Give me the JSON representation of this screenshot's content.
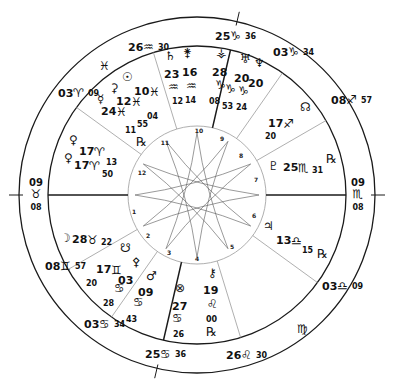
{
  "chart_title": "Natal Chart Wheel",
  "geometry": {
    "cx": 197,
    "cy": 195,
    "r_outer": 178,
    "r_zodiac": 149,
    "r_inner": 69,
    "colors": {
      "line": "#1a1a1a",
      "thin": "#9a9a9a",
      "text": "#111111"
    }
  },
  "house_cusps": [
    {
      "house": 1,
      "angle": 180,
      "heavy": true,
      "ext": true
    },
    {
      "house": 2,
      "angle": 150,
      "heavy": false
    },
    {
      "house": 3,
      "angle": 125,
      "heavy": false
    },
    {
      "house": 4,
      "angle": 103,
      "heavy": true,
      "ext": true
    },
    {
      "house": 5,
      "angle": 73,
      "heavy": false
    },
    {
      "house": 6,
      "angle": 36,
      "heavy": false
    },
    {
      "house": 7,
      "angle": 0,
      "heavy": true,
      "ext": true
    },
    {
      "house": 8,
      "angle": 330,
      "heavy": false
    },
    {
      "house": 9,
      "angle": 305,
      "heavy": false
    },
    {
      "house": 10,
      "angle": 283,
      "heavy": true,
      "ext": true
    },
    {
      "house": 11,
      "angle": 253,
      "heavy": false
    },
    {
      "house": 12,
      "angle": 216,
      "heavy": false
    }
  ],
  "house_numbers": [
    {
      "n": "1",
      "x": 134,
      "y": 214
    },
    {
      "n": "2",
      "x": 148,
      "y": 238
    },
    {
      "n": "3",
      "x": 169,
      "y": 255
    },
    {
      "n": "4",
      "x": 197,
      "y": 261
    },
    {
      "n": "5",
      "x": 232,
      "y": 249
    },
    {
      "n": "6",
      "x": 254,
      "y": 218
    },
    {
      "n": "7",
      "x": 256,
      "y": 182
    },
    {
      "n": "8",
      "x": 241,
      "y": 158
    },
    {
      "n": "9",
      "x": 222,
      "y": 141
    },
    {
      "n": "10",
      "x": 199,
      "y": 133
    },
    {
      "n": "11",
      "x": 165,
      "y": 145
    },
    {
      "n": "12",
      "x": 142,
      "y": 175
    }
  ],
  "cusp_labels": [
    {
      "id": "asc",
      "deg": "09",
      "sign": "♉",
      "min": "08",
      "x": 36,
      "y": 186
    },
    {
      "id": "dsc",
      "deg": "09",
      "sign": "♏",
      "min": "08",
      "x": 358,
      "y": 186
    },
    {
      "id": "mc",
      "deg": "25",
      "sign": "♑",
      "min": "36",
      "x": 215,
      "y": 40
    },
    {
      "id": "ic",
      "deg": "25",
      "sign": "♋",
      "min": "36",
      "x": 145,
      "y": 358
    },
    {
      "id": "c11",
      "deg": "26",
      "sign": "♒",
      "min": "30",
      "x": 128,
      "y": 51
    },
    {
      "id": "c12",
      "deg": "03",
      "sign": "♈",
      "min": "09",
      "x": 58,
      "y": 97
    },
    {
      "id": "c2",
      "deg": "08",
      "sign": "♊",
      "min": "57",
      "x": 45,
      "y": 270
    },
    {
      "id": "c3",
      "deg": "03",
      "sign": "♋",
      "min": "34",
      "x": 84,
      "y": 328
    },
    {
      "id": "c5",
      "deg": "26",
      "sign": "♌",
      "min": "30",
      "x": 226,
      "y": 359
    },
    {
      "id": "c6",
      "deg": "03",
      "sign": "♎",
      "min": "09",
      "x": 322,
      "y": 290
    },
    {
      "id": "c8",
      "deg": "08",
      "sign": "♐",
      "min": "57",
      "x": 331,
      "y": 104
    },
    {
      "id": "c9",
      "deg": "03",
      "sign": "♑",
      "min": "34",
      "x": 273,
      "y": 56
    }
  ],
  "intercepted_signs": [
    {
      "sign": "♓",
      "x": 99,
      "y": 70
    },
    {
      "sign": "♍",
      "x": 297,
      "y": 333
    }
  ],
  "planets": [
    {
      "name": "Sun",
      "glyph": "☉",
      "x": 122,
      "y": 81
    },
    {
      "name": "Ceres",
      "glyph": "⚳",
      "x": 110,
      "y": 92
    },
    {
      "name": "Mercury",
      "glyph": "☿",
      "x": 97,
      "y": 103
    },
    {
      "name": "Sun-deg",
      "deg": "10",
      "sign": "♓",
      "x": 134,
      "y": 95
    },
    {
      "name": "Ceres-deg",
      "deg": "12",
      "sign": "♓",
      "x": 116,
      "y": 105
    },
    {
      "name": "Mercury-deg",
      "deg": "24",
      "sign": "♓",
      "x": 101,
      "y": 115
    },
    {
      "name": "Mercury-min",
      "min": "55",
      "x": 137,
      "y": 127
    },
    {
      "name": "Ceres-min",
      "min": "04",
      "x": 147,
      "y": 119
    },
    {
      "name": "Sun-min",
      "min": "11",
      "x": 125,
      "y": 133
    },
    {
      "name": "Mercury-retro",
      "glyph": "℞",
      "x": 136,
      "y": 146
    },
    {
      "name": "Venus",
      "glyph": "♀",
      "x": 69,
      "y": 144
    },
    {
      "name": "Venus2",
      "glyph": "♀",
      "x": 64,
      "y": 162
    },
    {
      "name": "Venus-deg",
      "deg": "17",
      "sign": "♈",
      "x": 79,
      "y": 155
    },
    {
      "name": "Venus2-deg",
      "deg": "17",
      "sign": "♈",
      "x": 74,
      "y": 169
    },
    {
      "name": "Venus-min",
      "min": "13",
      "x": 106,
      "y": 165
    },
    {
      "name": "Venus2-min",
      "min": "50",
      "x": 102,
      "y": 177
    },
    {
      "name": "Saturn",
      "glyph": "♄",
      "x": 165,
      "y": 60
    },
    {
      "name": "Juno",
      "glyph": "⚵",
      "x": 183,
      "y": 57
    },
    {
      "name": "Saturn-deg",
      "deg": "23",
      "x": 164,
      "y": 78
    },
    {
      "name": "Juno-deg",
      "deg": "16",
      "x": 182,
      "y": 76
    },
    {
      "name": "Saturn-sign",
      "sign": "♒",
      "x": 168,
      "y": 91
    },
    {
      "name": "Juno-sign",
      "sign": "♒",
      "x": 186,
      "y": 90
    },
    {
      "name": "Saturn-min",
      "min": "12",
      "x": 172,
      "y": 104
    },
    {
      "name": "Juno-min",
      "min": "14",
      "x": 185,
      "y": 103
    },
    {
      "name": "Vesta",
      "glyph": "⚶",
      "x": 216,
      "y": 57
    },
    {
      "name": "Vesta-deg",
      "deg": "28",
      "x": 212,
      "y": 76
    },
    {
      "name": "Vesta-sign",
      "sign": "♑",
      "x": 215,
      "y": 89
    },
    {
      "name": "Vesta-min",
      "min": "08",
      "x": 209,
      "y": 104
    },
    {
      "name": "Uranus",
      "glyph": "♅",
      "x": 240,
      "y": 63
    },
    {
      "name": "Neptune",
      "glyph": "♆",
      "x": 254,
      "y": 67
    },
    {
      "name": "Uranus-deg",
      "deg": "20",
      "x": 234,
      "y": 82
    },
    {
      "name": "Neptune-deg",
      "deg": "20",
      "x": 248,
      "y": 87
    },
    {
      "name": "Uranus-sign",
      "sign": "♑",
      "x": 225,
      "y": 93
    },
    {
      "name": "Neptune-sign",
      "sign": "♑",
      "x": 238,
      "y": 95
    },
    {
      "name": "Uranus-min",
      "min": "53",
      "x": 222,
      "y": 109
    },
    {
      "name": "Neptune-min",
      "min": "24",
      "x": 236,
      "y": 110
    },
    {
      "name": "NorthNode",
      "glyph": "☊",
      "x": 300,
      "y": 111
    },
    {
      "name": "NorthNode-deg",
      "deg": "17",
      "sign": "♐",
      "x": 268,
      "y": 127
    },
    {
      "name": "NorthNode-min",
      "min": "20",
      "x": 265,
      "y": 139
    },
    {
      "name": "Pluto",
      "glyph": "♇",
      "x": 268,
      "y": 170
    },
    {
      "name": "Pluto-deg",
      "deg": "25",
      "sign": "♏",
      "min": "31",
      "x": 283,
      "y": 171
    },
    {
      "name": "Pluto-retro",
      "glyph": "℞",
      "x": 326,
      "y": 163
    },
    {
      "name": "Jupiter",
      "glyph": "♃",
      "x": 263,
      "y": 230
    },
    {
      "name": "Jupiter-deg",
      "deg": "13",
      "sign": "♎",
      "x": 276,
      "y": 244
    },
    {
      "name": "Jupiter-min",
      "min": "15",
      "x": 302,
      "y": 253
    },
    {
      "name": "Jupiter-retro",
      "glyph": "℞",
      "x": 317,
      "y": 258
    },
    {
      "name": "Chiron",
      "glyph": "⚷",
      "x": 208,
      "y": 277
    },
    {
      "name": "Chiron-deg",
      "deg": "19",
      "x": 203,
      "y": 294
    },
    {
      "name": "Chiron-sign",
      "sign": "♌",
      "x": 207,
      "y": 308
    },
    {
      "name": "Chiron-min",
      "min": "00",
      "x": 206,
      "y": 322
    },
    {
      "name": "Chiron-retro",
      "glyph": "℞",
      "x": 206,
      "y": 336
    },
    {
      "name": "Moon",
      "glyph": "☽",
      "x": 60,
      "y": 242
    },
    {
      "name": "Moon-deg",
      "deg": "28",
      "sign": "♉",
      "min": "22",
      "x": 72,
      "y": 243
    },
    {
      "name": "SouthNode",
      "glyph": "☋",
      "x": 120,
      "y": 252
    },
    {
      "name": "SouthNode-deg",
      "deg": "17",
      "sign": "♊",
      "x": 96,
      "y": 273
    },
    {
      "name": "SouthNode-min",
      "min": "20",
      "x": 86,
      "y": 286
    },
    {
      "name": "Pallas",
      "glyph": "⚴",
      "x": 132,
      "y": 266
    },
    {
      "name": "Pallas-deg",
      "deg": "03",
      "x": 118,
      "y": 284
    },
    {
      "name": "Pallas-sign",
      "sign": "♋",
      "x": 114,
      "y": 292
    },
    {
      "name": "Pallas-min",
      "min": "28",
      "x": 103,
      "y": 306
    },
    {
      "name": "Mars",
      "glyph": "♂",
      "x": 146,
      "y": 280
    },
    {
      "name": "Mars-deg",
      "deg": "09",
      "x": 138,
      "y": 296
    },
    {
      "name": "Mars-sign",
      "sign": "♋",
      "x": 133,
      "y": 306
    },
    {
      "name": "Mars-min",
      "min": "43",
      "x": 126,
      "y": 322
    },
    {
      "name": "PartOfFortune",
      "glyph": "⊗",
      "x": 175,
      "y": 292
    },
    {
      "name": "PoF-deg",
      "deg": "27",
      "x": 172,
      "y": 310
    },
    {
      "name": "PoF-sign",
      "sign": "♋",
      "x": 172,
      "y": 322
    },
    {
      "name": "PoF-min",
      "min": "26",
      "x": 173,
      "y": 337
    }
  ]
}
